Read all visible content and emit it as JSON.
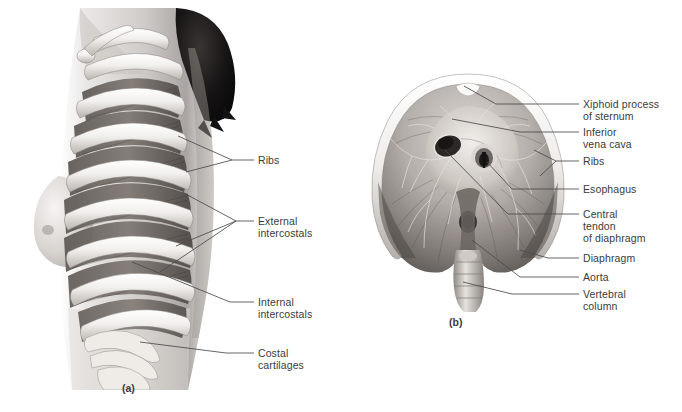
{
  "figure": {
    "background": "#ffffff",
    "text_color": "#3b3b3b",
    "leader_color": "#4a4a4a"
  },
  "panel_a": {
    "caption": "(a)",
    "description": "Lateral view of female thorax showing rib cage and intercostal muscles",
    "labels": [
      {
        "id": "ribs",
        "text": "Ribs",
        "x": 258,
        "y": 160
      },
      {
        "id": "external-intercostals",
        "text": "External\nintercostals",
        "x": 258,
        "y": 221
      },
      {
        "id": "internal-intercostals",
        "text": "Internal\nintercostals",
        "x": 258,
        "y": 296
      },
      {
        "id": "costal-cartilages",
        "text": "Costal\ncartilages",
        "x": 258,
        "y": 347
      }
    ]
  },
  "panel_b": {
    "caption": "(b)",
    "description": "Inferior view of the diaphragm showing its openings and central tendon",
    "labels": [
      {
        "id": "xiphoid-process",
        "text": "Xiphoid process\nof sternum",
        "x": 583,
        "y": 98
      },
      {
        "id": "inferior-vena-cava",
        "text": "Inferior\nvena cava",
        "x": 583,
        "y": 126
      },
      {
        "id": "ribs-b",
        "text": "Ribs",
        "x": 583,
        "y": 155
      },
      {
        "id": "esophagus",
        "text": "Esophagus",
        "x": 583,
        "y": 183
      },
      {
        "id": "central-tendon",
        "text": "Central\ntendon\nof diaphragm",
        "x": 583,
        "y": 208
      },
      {
        "id": "diaphragm",
        "text": "Diaphragm",
        "x": 583,
        "y": 252
      },
      {
        "id": "aorta",
        "text": "Aorta",
        "x": 583,
        "y": 271
      },
      {
        "id": "vertebral-column",
        "text": "Vertebral\ncolumn",
        "x": 583,
        "y": 288
      }
    ]
  }
}
